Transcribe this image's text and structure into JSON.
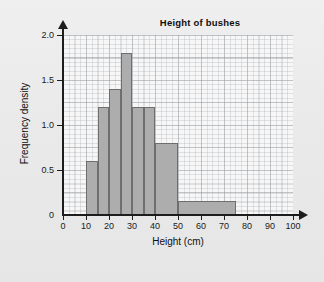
{
  "chart_data": {
    "type": "bar",
    "title": "Height of bushes",
    "xlabel": "Height (cm)",
    "ylabel": "Frequency density",
    "xlim": [
      0,
      100
    ],
    "ylim": [
      0,
      2.0
    ],
    "grid": true,
    "legend": null,
    "x_ticks": [
      0,
      10,
      20,
      30,
      40,
      50,
      60,
      70,
      80,
      90,
      100
    ],
    "x_tick_labels": [
      "0",
      "10",
      "20",
      "30",
      "40",
      "50",
      "60",
      "70",
      "80",
      "90",
      "100"
    ],
    "y_ticks": [
      0,
      0.5,
      1.0,
      1.5,
      2.0
    ],
    "y_tick_labels": [
      "0",
      "0.5",
      "1.0",
      "1.5",
      "2.0"
    ],
    "bins": [
      {
        "label": "10-15",
        "start": 10,
        "end": 15,
        "value": 0.6
      },
      {
        "label": "15-20",
        "start": 15,
        "end": 20,
        "value": 1.2
      },
      {
        "label": "20-25",
        "start": 20,
        "end": 25,
        "value": 1.4
      },
      {
        "label": "25-30",
        "start": 25,
        "end": 30,
        "value": 1.8
      },
      {
        "label": "30-35",
        "start": 30,
        "end": 35,
        "value": 1.2
      },
      {
        "label": "35-40",
        "start": 35,
        "end": 40,
        "value": 1.2
      },
      {
        "label": "40-50",
        "start": 40,
        "end": 50,
        "value": 0.8
      },
      {
        "label": "50-75",
        "start": 50,
        "end": 75,
        "value": 0.16
      }
    ],
    "colors": {
      "bar_fill": "#adadad",
      "bar_stroke": "#6e6e6e",
      "axis": "#1d1d1d",
      "plot_background": "#f7f7f7",
      "page_background": "#ececec",
      "grid": "#a5aaaf",
      "text": "#101010"
    }
  }
}
